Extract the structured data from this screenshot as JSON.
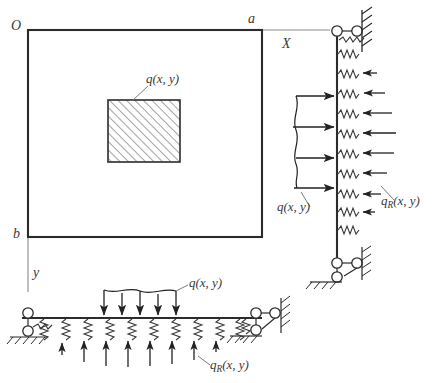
{
  "figure": {
    "colors": {
      "plate_edge": "#2b2b2b",
      "axis": "#6e6e6e",
      "hatch": "#555555",
      "arrow": "#222222",
      "spring": "#3a3a3a",
      "text": "#3a3a3a",
      "background": "#ffffff"
    }
  },
  "plan_view": {
    "name": "plan-view",
    "origin_label": "O",
    "corner_a_label": "a",
    "corner_b_label": "b",
    "x_axis_label": "X",
    "y_axis_label": "y",
    "load_label": "q(x, y)",
    "plate": {
      "x": 28,
      "y": 30,
      "width": 234,
      "height": 207
    },
    "loaded_patch": {
      "x": 108,
      "y": 100,
      "width": 72,
      "height": 62,
      "hatch": "diagonal-45"
    }
  },
  "side_view": {
    "name": "right-elevation-view",
    "applied_load_label": "q(x, y)",
    "reaction_label": "qR(x, y)",
    "reaction_label_main": "q",
    "reaction_label_sub": "R",
    "reaction_label_tail": "(x, y)",
    "beam": {
      "x": 337,
      "y_top": 35,
      "y_bottom": 258
    },
    "spring_count": 11,
    "applied_arrow_count": 4,
    "reaction_arrow_count": 8,
    "top_support": "roller-pin-hatched",
    "bottom_support": "roller-pin-hatched"
  },
  "bottom_view": {
    "name": "bottom-elevation-view",
    "applied_load_label": "q(x, y)",
    "reaction_label_main": "q",
    "reaction_label_sub": "R",
    "reaction_label_tail": "(x, y)",
    "beam": {
      "x_left": 22,
      "x_right": 262,
      "y": 318
    },
    "spring_count": 11,
    "applied_arrow_count": 5,
    "reaction_arrow_count": 8,
    "left_support": "pin-hatched",
    "right_support": "roller-pin-hatched"
  }
}
